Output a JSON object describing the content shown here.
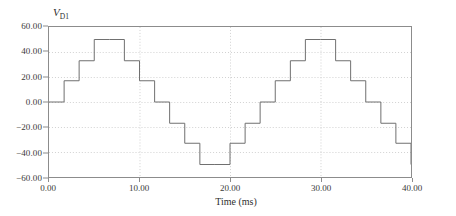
{
  "chart_data": {
    "type": "line",
    "title": "",
    "series_label": "V",
    "series_label_sub": "D1",
    "xlabel": "Time (ms)",
    "ylabel": "",
    "xlim": [
      0,
      40
    ],
    "ylim": [
      -60,
      60
    ],
    "xticks": [
      0,
      10,
      20,
      30,
      40
    ],
    "xticklabels": [
      "0.00",
      "10.00",
      "20.00",
      "30.00",
      "40.00"
    ],
    "yticks": [
      -60,
      -40,
      -20,
      0,
      20,
      40,
      60
    ],
    "yticklabels": [
      "-60.00",
      "-40.00",
      "-20.00",
      "0.00",
      "20.00",
      "40.00",
      "60.00"
    ],
    "grid": true,
    "grid_style": "dotted",
    "legend": "none",
    "line_color": "#6e6e6e",
    "grid_color": "#d0d0d0",
    "axis_color": "#8c8c8c",
    "drawstyle": "steps-post",
    "period_ms": 20,
    "steps_per_period": 12,
    "amplitude": 50,
    "step_levels": [
      0,
      17,
      33,
      50,
      50,
      33,
      17,
      0,
      -17,
      -33,
      -50,
      -50,
      -33,
      -17
    ],
    "x": [
      0.0,
      1.67,
      3.33,
      5.0,
      6.67,
      8.33,
      10.0,
      11.67,
      13.33,
      15.0,
      16.67,
      18.33,
      20.0,
      21.67,
      23.33,
      25.0,
      26.67,
      28.33,
      30.0,
      31.67,
      33.33,
      35.0,
      36.67,
      38.33,
      40.0
    ],
    "y": [
      0,
      17,
      33,
      50,
      50,
      33,
      17,
      0,
      -17,
      -33,
      -50,
      -50,
      -33,
      -17,
      0,
      17,
      33,
      50,
      50,
      33,
      17,
      0,
      -17,
      -33,
      -50
    ]
  }
}
